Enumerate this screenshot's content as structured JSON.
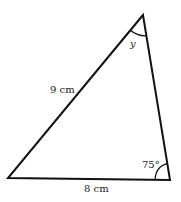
{
  "diagram": {
    "type": "triangle",
    "labels": {
      "left_side": "9 cm",
      "bottom_side": "8 cm",
      "top_angle": "y",
      "bottom_right_angle": "75°"
    },
    "colors": {
      "stroke": "#111111",
      "text": "#222222",
      "background": "#ffffff"
    }
  }
}
